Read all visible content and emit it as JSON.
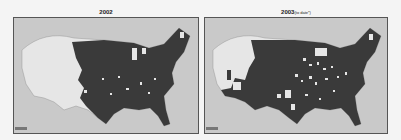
{
  "maps": [
    {
      "title": "2002",
      "title_suffix": "",
      "credit_label": "USGS",
      "description": "Contiguous United States county map; dark shading covers most counties east of the Rockies, western states mostly light."
    },
    {
      "title": "2003",
      "title_suffix": "(to date*)",
      "credit_label": "USGS",
      "description": "Contiguous United States county map; dark shading across Great Plains, Southwest and East with many light counties scattered in Midwest and South."
    }
  ],
  "colors": {
    "background": "#f4f4f4",
    "ocean": "#c9c9c9",
    "land_light": "#e6e6e6",
    "affected": "#3a3a3a",
    "border": "#555555"
  }
}
